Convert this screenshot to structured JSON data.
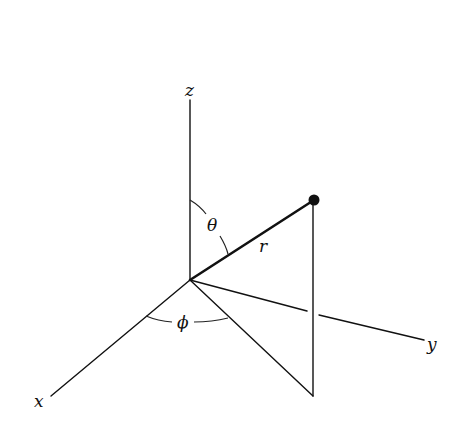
{
  "diagram": {
    "labels": {
      "z_axis": "z",
      "x_axis": "x",
      "y_axis": "y",
      "radius": "r",
      "polar_angle": "θ",
      "azimuth_angle": "ϕ"
    },
    "colors": {
      "stroke": "#111111",
      "background": "#ffffff"
    },
    "points": {
      "origin": [
        190,
        280
      ],
      "z_end": [
        190,
        100
      ],
      "x_end": [
        51,
        396
      ],
      "y_end": [
        424,
        340
      ],
      "point_P": [
        314,
        200
      ],
      "projection": [
        313,
        396
      ]
    }
  }
}
